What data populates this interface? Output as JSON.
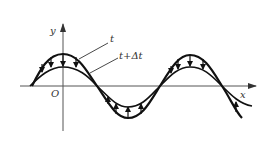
{
  "diagram": {
    "title": "",
    "labels": {
      "y_axis": "y",
      "x_axis": "x",
      "origin": "O",
      "curve_t": "t",
      "curve_t_dt": "t+Δt"
    },
    "colors": {
      "curve": "#111111",
      "axis": "#555555",
      "text": "#333333",
      "background": "#ffffff"
    }
  }
}
